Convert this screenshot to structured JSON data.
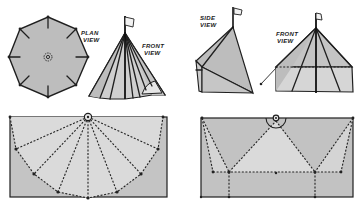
{
  "figure": {
    "colors": {
      "canvas_dark": "#bcbcbc",
      "canvas_light": "#dadada",
      "canvas_mid": "#c9c9c9",
      "line": "#1f1f1f",
      "background": "#ffffff"
    },
    "panels": [
      {
        "id": "bell-plan",
        "label_line1": "PLAN",
        "label_line2": "VIEW"
      },
      {
        "id": "bell-front",
        "label_line1": "FRONT",
        "label_line2": "VIEW"
      },
      {
        "id": "wall-side",
        "label_line1": "SIDE",
        "label_line2": "VIEW"
      },
      {
        "id": "wall-front",
        "label_line1": "FRONT",
        "label_line2": "VIEW"
      },
      {
        "id": "bell-pattern",
        "label_line1": "",
        "label_line2": ""
      },
      {
        "id": "wall-pattern",
        "label_line1": "",
        "label_line2": ""
      }
    ]
  }
}
